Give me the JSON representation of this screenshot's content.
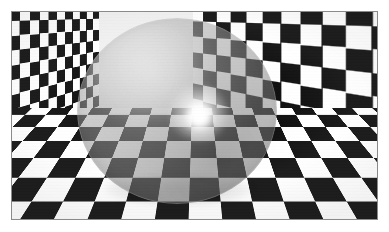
{
  "image": {
    "title": "Checkerboard room with translucent sphere",
    "subject": "sphere",
    "scene_type": "optical-illusion photograph",
    "width_px": 389,
    "height_px": 232,
    "border": {
      "style": "white margin with thin grey rule",
      "margin_px": 11,
      "rule_color": "#8a8a8a",
      "background_color": "#ffffff"
    },
    "palette": {
      "check_dark": "#111111",
      "check_light": "#ffffff",
      "sphere_veil": "#969696",
      "highlight": "#ffffff",
      "shadow": "#000000"
    },
    "scene": {
      "description": "A three-sided corner of a room tiled edge-to-edge with a high-contrast black and white checkerboard, photographed with strong wide-angle perspective so the squares enlarge toward the frame edges.",
      "planes": [
        {
          "name": "left-wall",
          "label": "Left wall",
          "checker_size_px": 33,
          "recedes_to": "center corner"
        },
        {
          "name": "right-wall",
          "label": "Right wall",
          "checker_size_px": 33,
          "recedes_to": "center corner"
        },
        {
          "name": "floor",
          "label": "Floor",
          "checker_size_px": 40,
          "recedes_to": "center corner"
        }
      ],
      "corner_point": {
        "x_px": 195,
        "y_px": 100,
        "label": "Room corner / vanishing point"
      }
    },
    "sphere": {
      "label": "Translucent sphere",
      "center_x_px": 177,
      "center_y_px": 111,
      "width_px": 200,
      "height_px": 186,
      "opacity_description": "semi-transparent; checkerboard shows through at reduced contrast",
      "veil_opacity": 0.5,
      "effect": "checks inside the sphere appear grey rather than black and white",
      "highlight": {
        "label": "Specular highlight",
        "x_px": 199,
        "y_px": 113,
        "color": "#ffffff"
      },
      "sheen": {
        "label": "Soft sheen",
        "position": "upper-left"
      },
      "rim_shading": {
        "label": "Rim shading",
        "position": "outer edge, strongest lower-left"
      },
      "contact_shadow": {
        "label": "Contact shadow",
        "x_px": 179,
        "y_px": 189
      }
    }
  }
}
